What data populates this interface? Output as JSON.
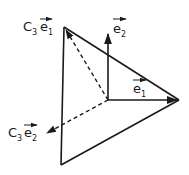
{
  "diagram": {
    "type": "vector-triangle",
    "stroke_color": "#1a1a1a",
    "background": "#ffffff",
    "vertices": {
      "top": [
        64,
        27
      ],
      "right": [
        179,
        100
      ],
      "bottom": [
        61,
        165
      ],
      "origin": [
        108,
        100
      ]
    },
    "vectors": [
      {
        "id": "e1",
        "from": [
          108,
          100
        ],
        "to": [
          179,
          100
        ],
        "style": "solid"
      },
      {
        "id": "e2",
        "from": [
          108,
          100
        ],
        "to": [
          108,
          34
        ],
        "style": "solid"
      },
      {
        "id": "C3e1",
        "from": [
          108,
          100
        ],
        "to": [
          64,
          27
        ],
        "style": "dashed"
      },
      {
        "id": "C3e2",
        "from": [
          108,
          100
        ],
        "to": [
          46,
          134
        ],
        "style": "dashed"
      }
    ],
    "labels": {
      "c3e1": {
        "prefix": "C",
        "prefix_sub": "3",
        "vec": "e",
        "vec_sub": "1"
      },
      "c3e2": {
        "prefix": "C",
        "prefix_sub": "3",
        "vec": "e",
        "vec_sub": "2"
      },
      "e1": {
        "vec": "e",
        "vec_sub": "1"
      },
      "e2": {
        "vec": "e",
        "vec_sub": "2"
      }
    }
  }
}
